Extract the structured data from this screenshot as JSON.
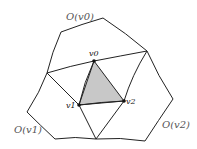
{
  "labels": {
    "v0": "v0",
    "v1": "v1",
    "v2": "v2",
    "o_v0": "O(v0)",
    "o_v1": "O(v1)",
    "o_v2": "O(v2)"
  },
  "colors": {
    "stroke": "#222222",
    "fill": "#c8c8c8"
  }
}
